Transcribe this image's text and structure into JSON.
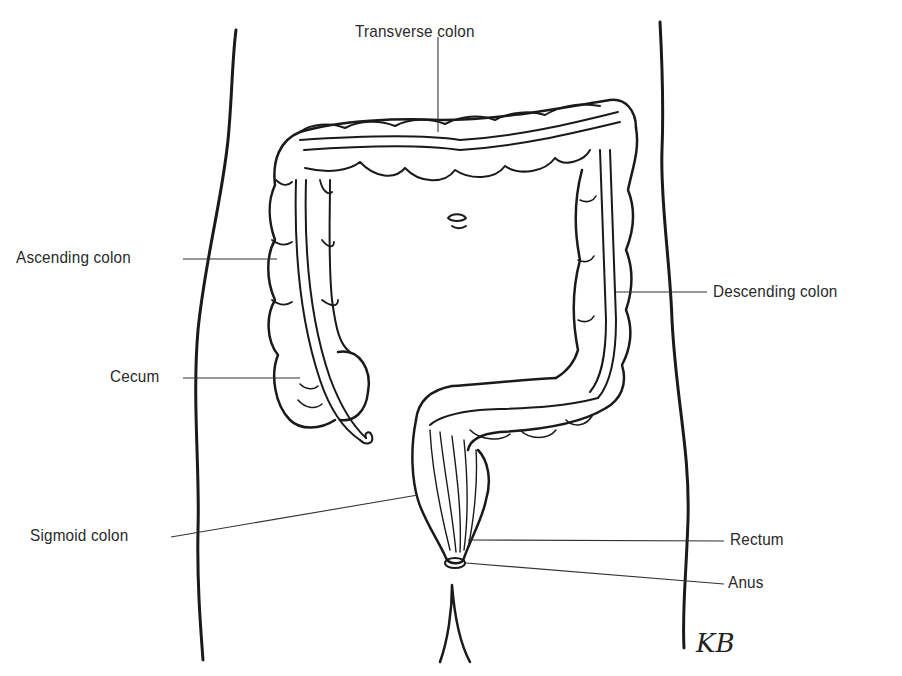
{
  "diagram": {
    "type": "anatomical-illustration",
    "labels": [
      {
        "id": "transverse",
        "text": "Transverse colon"
      },
      {
        "id": "ascending",
        "text": "Ascending colon"
      },
      {
        "id": "descending",
        "text": "Descending colon"
      },
      {
        "id": "cecum",
        "text": "Cecum"
      },
      {
        "id": "sigmoid",
        "text": "Sigmoid colon"
      },
      {
        "id": "rectum",
        "text": "Rectum"
      },
      {
        "id": "anus",
        "text": "Anus"
      }
    ],
    "signature": "KB"
  }
}
